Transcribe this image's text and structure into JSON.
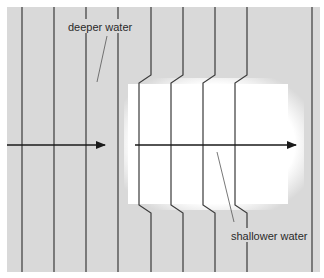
{
  "diagram": {
    "labels": {
      "deeper": "deeper water",
      "shallower": "shallower water"
    },
    "colors": {
      "deep_bg": "#d9d9d9",
      "shallow_bg": "#ffffff",
      "line": "#3a3a3a",
      "text": "#2a2a2a"
    },
    "wavefronts_straight_x": [
      22,
      54,
      86,
      118,
      312
    ],
    "wavefronts_stepped": [
      {
        "outer_x": 151,
        "inner_x": 139
      },
      {
        "outer_x": 183,
        "inner_x": 171
      },
      {
        "outer_x": 215,
        "inner_x": 203
      },
      {
        "outer_x": 247,
        "inner_x": 235
      }
    ],
    "arrows": [
      {
        "from_x": 7,
        "to_x": 105,
        "y": 145
      },
      {
        "from_x": 135,
        "to_x": 296,
        "y": 145
      }
    ]
  }
}
